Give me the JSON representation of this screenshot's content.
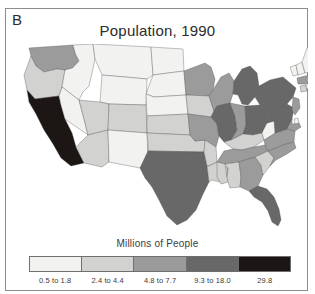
{
  "figure": {
    "panel_label": "B",
    "title": "Population, 1990",
    "frame_color": "#8d8d8d",
    "background": "#ffffff",
    "outline_color": "#4a4a4a"
  },
  "legend": {
    "title": "Millions of People",
    "classes": [
      {
        "label": "0.5 to 1.8",
        "color": "#f2f2f0"
      },
      {
        "label": "2.4 to 4.4",
        "color": "#d2d2d0"
      },
      {
        "label": "4.8 to 7.7",
        "color": "#9b9b9b"
      },
      {
        "label": "9.3 to 18.0",
        "color": "#686868"
      },
      {
        "label": "29.8",
        "color": "#1c1614"
      }
    ]
  },
  "chart_data": {
    "type": "map",
    "subtype": "choropleth",
    "title": "Population, 1990",
    "panel": "B",
    "region": "Contiguous United States",
    "unit": "Millions of People",
    "legend_position": "bottom",
    "class_breaks": [
      "0.5 to 1.8",
      "2.4 to 4.4",
      "4.8 to 7.7",
      "9.3 to 18.0",
      "29.8"
    ],
    "class_colors": [
      "#f2f2f0",
      "#d2d2d0",
      "#9b9b9b",
      "#686868",
      "#1c1614"
    ],
    "states": [
      {
        "code": "WA",
        "name": "Washington",
        "class": 2
      },
      {
        "code": "OR",
        "name": "Oregon",
        "class": 1
      },
      {
        "code": "CA",
        "name": "California",
        "class": 4
      },
      {
        "code": "ID",
        "name": "Idaho",
        "class": 0
      },
      {
        "code": "NV",
        "name": "Nevada",
        "class": 0
      },
      {
        "code": "MT",
        "name": "Montana",
        "class": 0
      },
      {
        "code": "WY",
        "name": "Wyoming",
        "class": 0
      },
      {
        "code": "UT",
        "name": "Utah",
        "class": 1
      },
      {
        "code": "AZ",
        "name": "Arizona",
        "class": 1
      },
      {
        "code": "CO",
        "name": "Colorado",
        "class": 1
      },
      {
        "code": "NM",
        "name": "New Mexico",
        "class": 0
      },
      {
        "code": "ND",
        "name": "North Dakota",
        "class": 0
      },
      {
        "code": "SD",
        "name": "South Dakota",
        "class": 0
      },
      {
        "code": "NE",
        "name": "Nebraska",
        "class": 0
      },
      {
        "code": "KS",
        "name": "Kansas",
        "class": 1
      },
      {
        "code": "OK",
        "name": "Oklahoma",
        "class": 1
      },
      {
        "code": "TX",
        "name": "Texas",
        "class": 3
      },
      {
        "code": "MN",
        "name": "Minnesota",
        "class": 2
      },
      {
        "code": "IA",
        "name": "Iowa",
        "class": 1
      },
      {
        "code": "MO",
        "name": "Missouri",
        "class": 2
      },
      {
        "code": "AR",
        "name": "Arkansas",
        "class": 1
      },
      {
        "code": "LA",
        "name": "Louisiana",
        "class": 1
      },
      {
        "code": "WI",
        "name": "Wisconsin",
        "class": 2
      },
      {
        "code": "IL",
        "name": "Illinois",
        "class": 3
      },
      {
        "code": "MI",
        "name": "Michigan",
        "class": 3
      },
      {
        "code": "IN",
        "name": "Indiana",
        "class": 2
      },
      {
        "code": "OH",
        "name": "Ohio",
        "class": 3
      },
      {
        "code": "KY",
        "name": "Kentucky",
        "class": 1
      },
      {
        "code": "TN",
        "name": "Tennessee",
        "class": 2
      },
      {
        "code": "MS",
        "name": "Mississippi",
        "class": 1
      },
      {
        "code": "AL",
        "name": "Alabama",
        "class": 1
      },
      {
        "code": "GA",
        "name": "Georgia",
        "class": 2
      },
      {
        "code": "FL",
        "name": "Florida",
        "class": 3
      },
      {
        "code": "SC",
        "name": "South Carolina",
        "class": 1
      },
      {
        "code": "NC",
        "name": "North Carolina",
        "class": 2
      },
      {
        "code": "VA",
        "name": "Virginia",
        "class": 2
      },
      {
        "code": "WV",
        "name": "West Virginia",
        "class": 0
      },
      {
        "code": "PA",
        "name": "Pennsylvania",
        "class": 3
      },
      {
        "code": "NY",
        "name": "New York",
        "class": 3
      },
      {
        "code": "MD",
        "name": "Maryland",
        "class": 2
      },
      {
        "code": "DE",
        "name": "Delaware",
        "class": 0
      },
      {
        "code": "NJ",
        "name": "New Jersey",
        "class": 2
      },
      {
        "code": "CT",
        "name": "Connecticut",
        "class": 1
      },
      {
        "code": "RI",
        "name": "Rhode Island",
        "class": 0
      },
      {
        "code": "MA",
        "name": "Massachusetts",
        "class": 2
      },
      {
        "code": "VT",
        "name": "Vermont",
        "class": 0
      },
      {
        "code": "NH",
        "name": "New Hampshire",
        "class": 0
      },
      {
        "code": "ME",
        "name": "Maine",
        "class": 0
      }
    ]
  }
}
